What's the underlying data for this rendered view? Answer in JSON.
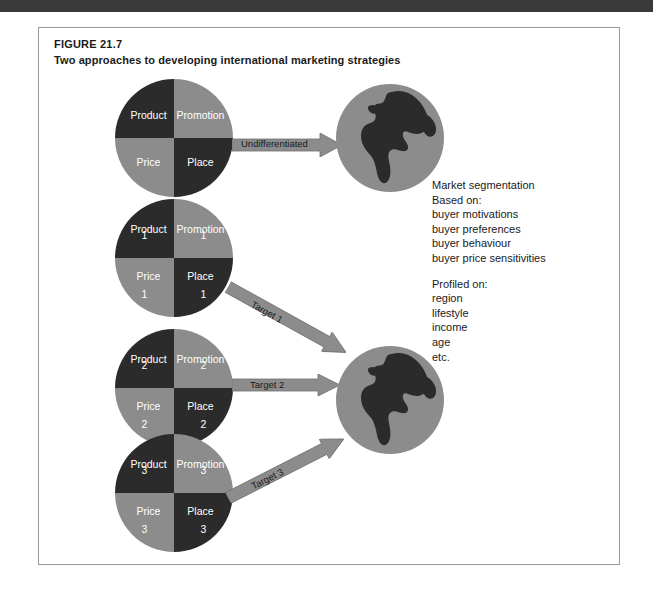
{
  "page": {
    "top_band_color": "#3a3a3a",
    "background_color": "#ffffff"
  },
  "figure": {
    "label": "FIGURE 21.7",
    "title": "Two approaches to developing international marketing strategies",
    "border_color": "#9a9a9a"
  },
  "colors": {
    "dark_segment": "#2b2b2b",
    "light_segment": "#8c8c8c",
    "globe_fill": "#8c8c8c",
    "landmass": "#2b2b2b",
    "arrow_fill": "#8c8c8c",
    "arrow_stroke": "#6f6f6f",
    "text": "#1a1a1a",
    "segment_text": "#ffffff"
  },
  "mix_charts": [
    {
      "id": "mix-undifferentiated",
      "name": "marketing-mix-undifferentiated",
      "quadrants": [
        {
          "position": "top-left",
          "label": "Product",
          "number": "",
          "shade": "dark"
        },
        {
          "position": "top-right",
          "label": "Promotion",
          "number": "",
          "shade": "light"
        },
        {
          "position": "bottom-left",
          "label": "Price",
          "number": "",
          "shade": "light"
        },
        {
          "position": "bottom-right",
          "label": "Place",
          "number": "",
          "shade": "dark"
        }
      ]
    },
    {
      "id": "mix-target-1",
      "name": "marketing-mix-1",
      "quadrants": [
        {
          "position": "top-left",
          "label": "Product",
          "number": "1",
          "shade": "dark"
        },
        {
          "position": "top-right",
          "label": "Promotion",
          "number": "1",
          "shade": "light"
        },
        {
          "position": "bottom-left",
          "label": "Price",
          "number": "1",
          "shade": "light"
        },
        {
          "position": "bottom-right",
          "label": "Place",
          "number": "1",
          "shade": "dark"
        }
      ]
    },
    {
      "id": "mix-target-2",
      "name": "marketing-mix-2",
      "quadrants": [
        {
          "position": "top-left",
          "label": "Product",
          "number": "2",
          "shade": "dark"
        },
        {
          "position": "top-right",
          "label": "Promotion",
          "number": "2",
          "shade": "light"
        },
        {
          "position": "bottom-left",
          "label": "Price",
          "number": "2",
          "shade": "light"
        },
        {
          "position": "bottom-right",
          "label": "Place",
          "number": "2",
          "shade": "dark"
        }
      ]
    },
    {
      "id": "mix-target-3",
      "name": "marketing-mix-3",
      "quadrants": [
        {
          "position": "top-left",
          "label": "Product",
          "number": "3",
          "shade": "dark"
        },
        {
          "position": "top-right",
          "label": "Promotion",
          "number": "3",
          "shade": "light"
        },
        {
          "position": "bottom-left",
          "label": "Price",
          "number": "3",
          "shade": "light"
        },
        {
          "position": "bottom-right",
          "label": "Place",
          "number": "3",
          "shade": "dark"
        }
      ]
    }
  ],
  "globes": [
    {
      "id": "globe-top",
      "name": "world-market-globe-undifferentiated"
    },
    {
      "id": "globe-bottom",
      "name": "world-market-globe-segmented"
    }
  ],
  "arrows": [
    {
      "id": "arrow-undifferentiated",
      "label": "Undifferentiated"
    },
    {
      "id": "arrow-target-1",
      "label": "Target 1"
    },
    {
      "id": "arrow-target-2",
      "label": "Target 2"
    },
    {
      "id": "arrow-target-3",
      "label": "Target 3"
    }
  ],
  "segmentation": {
    "heading": "Market segmentation",
    "based_on_label": "Based on:",
    "based_on_items": [
      "buyer motivations",
      "buyer preferences",
      "buyer behaviour",
      "buyer price sensitivities"
    ],
    "profiled_on_label": "Profiled on:",
    "profiled_on_items": [
      "region",
      "lifestyle",
      "income",
      "age",
      "etc."
    ]
  }
}
